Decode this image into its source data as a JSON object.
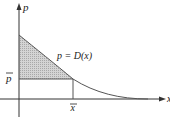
{
  "diagram": {
    "type": "consumer-surplus",
    "y_axis_label": "p",
    "x_axis_label": "x",
    "curve_label": "p = D(x)",
    "price_label": "p",
    "quantity_label": "x",
    "colors": {
      "axis": "#333333",
      "curve": "#555555",
      "shaded_region": "#c8c8c8",
      "guide_lines": "#555555",
      "text": "#222222"
    }
  }
}
